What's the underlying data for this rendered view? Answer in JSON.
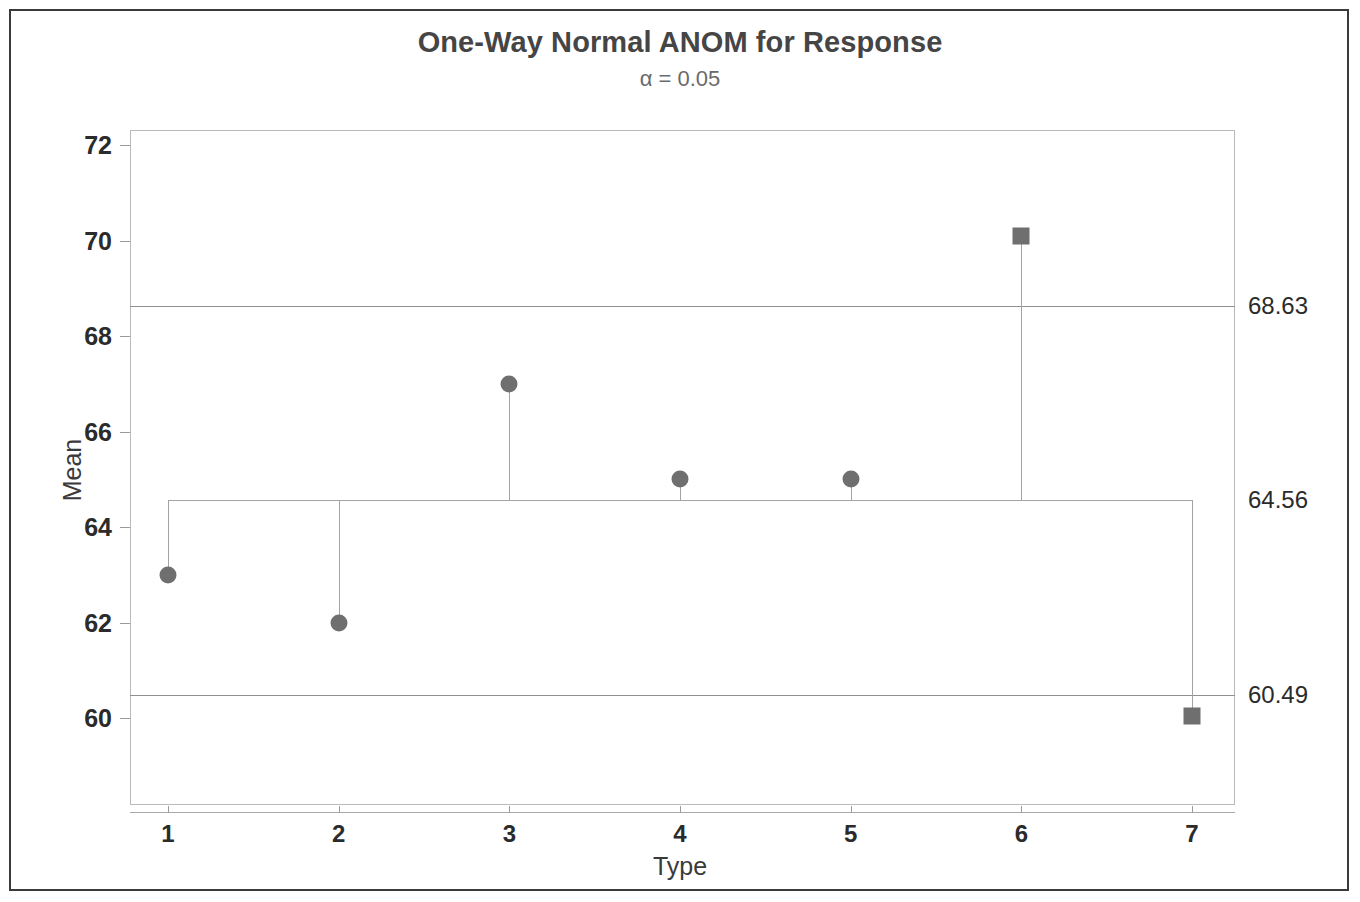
{
  "chart_data": {
    "type": "scatter",
    "title": "One-Way Normal ANOM for Response",
    "subtitle": "α = 0.05",
    "xlabel": "Type",
    "ylabel": "Mean",
    "categories": [
      "1",
      "2",
      "3",
      "4",
      "5",
      "6",
      "7"
    ],
    "values": [
      63.0,
      62.0,
      67.0,
      65.0,
      65.0,
      70.1,
      60.05
    ],
    "point_markers": [
      "circle",
      "circle",
      "circle",
      "circle",
      "circle",
      "square",
      "square"
    ],
    "out_of_limits": [
      false,
      false,
      false,
      false,
      false,
      true,
      true
    ],
    "center_line": 64.56,
    "upper_decision_limit": 68.63,
    "lower_decision_limit": 60.49,
    "limit_labels": {
      "udl": "68.63",
      "center": "64.56",
      "ldl": "60.49"
    },
    "yticks": [
      "72",
      "70",
      "68",
      "66",
      "64",
      "62",
      "60"
    ],
    "ytick_values": [
      72,
      70,
      68,
      66,
      64,
      62,
      60
    ],
    "ylim": [
      58.8,
      72.9
    ],
    "grid": false,
    "legend": "none",
    "colors": {
      "marker": "#6f6f6f",
      "limit_line": "#909090",
      "center_line": "#a5a5a5",
      "stem": "#a3a3a3",
      "title_text": "#454545",
      "axis_text": "#2b2b2b",
      "plot_border": "#b9b9b9",
      "outer_border": "#3a3a3a",
      "background": "#ffffff"
    }
  }
}
